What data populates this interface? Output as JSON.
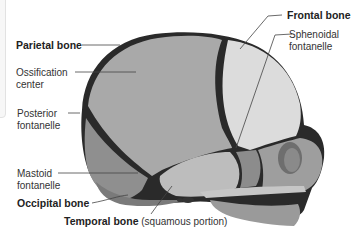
{
  "figure": {
    "labels": {
      "parietal_bone": "Parietal bone",
      "ossification_center_1": "Ossification",
      "ossification_center_2": "center",
      "posterior_fontanelle_1": "Posterior",
      "posterior_fontanelle_2": "fontanelle",
      "mastoid_fontanelle_1": "Mastoid",
      "mastoid_fontanelle_2": "fontanelle",
      "occipital_bone": "Occipital bone",
      "temporal_bone": "Temporal bone",
      "temporal_bone_note": "(squamous portion)",
      "frontal_bone": "Frontal bone",
      "sphenoidal_fontanelle_1": "Sphenoidal",
      "sphenoidal_fontanelle_2": "fontanelle"
    },
    "colors": {
      "parietal": "#a9a9a9",
      "frontal": "#dcdcdc",
      "occipital": "#8f8f8f",
      "temporal": "#bdbdbd",
      "sutures": "#1e1e1e",
      "leader_lines": "#444444"
    }
  }
}
